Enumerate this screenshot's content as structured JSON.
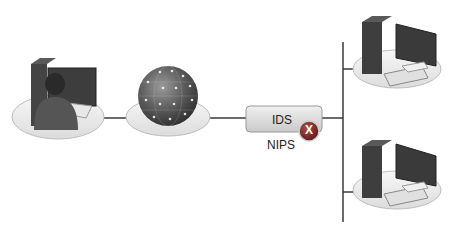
{
  "diagram": {
    "nodes": [
      {
        "id": "user-workstation",
        "icon": "person-at-computer-icon"
      },
      {
        "id": "internet",
        "icon": "globe-network-icon"
      },
      {
        "id": "ids",
        "label": "IDS",
        "badge": "X",
        "sublabel": "NIPS"
      },
      {
        "id": "server-1",
        "icon": "desktop-computer-icon"
      },
      {
        "id": "server-2",
        "icon": "desktop-computer-icon"
      }
    ],
    "colors": {
      "line": "#3a3a3a",
      "platform": "#e6e6e6",
      "ids_box": "#d9d9d9",
      "badge": "#8a2a2a"
    }
  }
}
